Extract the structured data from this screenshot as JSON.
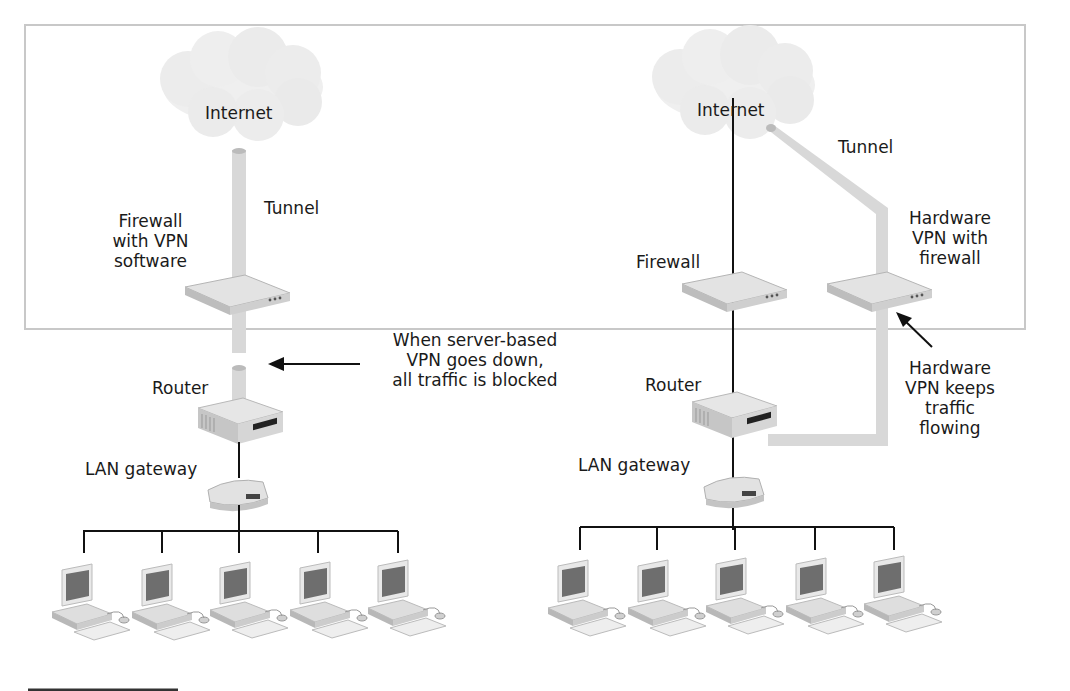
{
  "diagram": {
    "colors": {
      "frame_border": "#c8c8c8",
      "tunnel": "#d9d9d9",
      "cloud": "#eeeeee",
      "line": "#111111",
      "device": "#d6d6d6"
    },
    "left": {
      "internet_label": "Internet",
      "tunnel_label": "Tunnel",
      "firewall_label_lines": [
        "Firewall",
        "with VPN",
        "software"
      ],
      "router_label": "Router",
      "lan_gateway_label": "LAN gateway",
      "callout_lines": [
        "When server-based",
        "VPN goes down,",
        "all traffic is blocked"
      ],
      "computer_count": 5
    },
    "right": {
      "internet_label": "Internet",
      "tunnel_label": "Tunnel",
      "firewall_label": "Firewall",
      "hardware_vpn_label_lines": [
        "Hardware",
        "VPN with",
        "firewall"
      ],
      "router_label": "Router",
      "lan_gateway_label": "LAN gateway",
      "callout_lines": [
        "Hardware",
        "VPN keeps",
        "traffic",
        "flowing"
      ],
      "computer_count": 5
    }
  }
}
